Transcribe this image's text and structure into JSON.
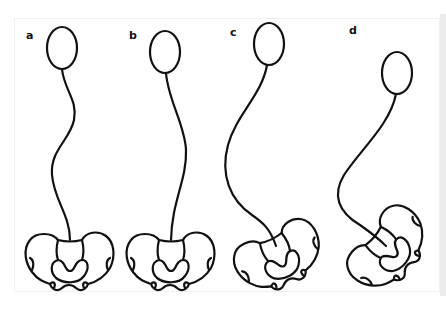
{
  "figure": {
    "type": "schematic line drawing",
    "stroke_color": "#111111",
    "background_color": "#ffffff",
    "panels": [
      {
        "label": "a",
        "pelvis_rotation_deg": 0
      },
      {
        "label": "b",
        "pelvis_rotation_deg": 0
      },
      {
        "label": "c",
        "pelvis_rotation_deg": -25
      },
      {
        "label": "d",
        "pelvis_rotation_deg": -50
      }
    ]
  }
}
